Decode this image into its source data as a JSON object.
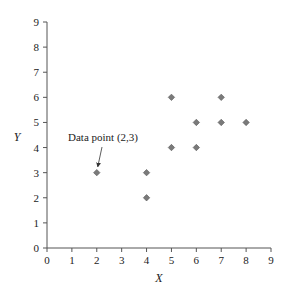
{
  "chart_data": {
    "type": "scatter",
    "title": "",
    "xlabel": "X",
    "ylabel": "Y",
    "xlim": [
      0,
      9
    ],
    "ylim": [
      0,
      9
    ],
    "xticks": [
      0,
      1,
      2,
      3,
      4,
      5,
      6,
      7,
      8,
      9
    ],
    "yticks": [
      0,
      1,
      2,
      3,
      4,
      5,
      6,
      7,
      8,
      9
    ],
    "grid": false,
    "legend": null,
    "series": [
      {
        "name": "data",
        "marker": "diamond",
        "color": "#7a7a7a",
        "points": [
          {
            "x": 2,
            "y": 3
          },
          {
            "x": 4,
            "y": 3
          },
          {
            "x": 4,
            "y": 2
          },
          {
            "x": 5,
            "y": 6
          },
          {
            "x": 5,
            "y": 4
          },
          {
            "x": 6,
            "y": 5
          },
          {
            "x": 6,
            "y": 4
          },
          {
            "x": 7,
            "y": 6
          },
          {
            "x": 7,
            "y": 5
          },
          {
            "x": 8,
            "y": 5
          }
        ]
      }
    ],
    "annotations": [
      {
        "text": "Data point (2,3)",
        "target": {
          "x": 2,
          "y": 3
        },
        "arrow": true
      }
    ]
  }
}
